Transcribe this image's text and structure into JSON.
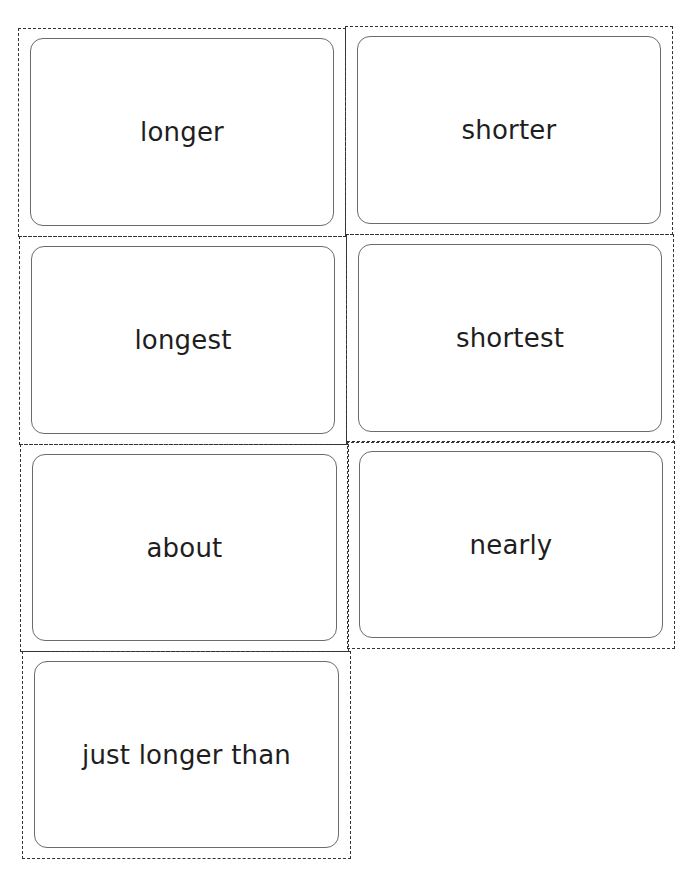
{
  "sheet": {
    "cards": [
      {
        "word": "longer"
      },
      {
        "word": "shorter"
      },
      {
        "word": "longest"
      },
      {
        "word": "shortest"
      },
      {
        "word": "about"
      },
      {
        "word": "nearly"
      },
      {
        "word": "just longer than"
      }
    ]
  }
}
